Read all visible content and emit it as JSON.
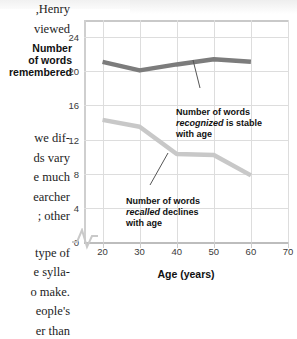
{
  "page": {
    "body_text_lines_top": [
      ",Henry",
      "viewed"
    ],
    "body_text_lines_mid": [
      "we dif-",
      "ds vary",
      "e much",
      "earcher",
      "; other"
    ],
    "body_text_lines_bottom": [
      "type of",
      "e sylla-",
      "o make.",
      "eople's",
      "er than"
    ]
  },
  "figure": {
    "y_axis_title_lines": [
      "Number",
      "of words",
      "remembered"
    ],
    "x_axis_title": "Age (years)",
    "annotation_recognized": {
      "line1": "Number of words",
      "line2_italic": "recognized",
      "line2_rest": " is stable",
      "line3": "with age"
    },
    "annotation_recalled": {
      "line1": "Number of words",
      "line2_italic": "recalled",
      "line2_rest": " declines",
      "line3": "with age"
    },
    "colors": {
      "recognized_line": "#7c7c7c",
      "recalled_line": "#c8c8c8",
      "gridline": "#dddddd",
      "axis": "#c9c9c9",
      "text": "#111111"
    }
  },
  "chart_data": {
    "type": "line",
    "title": "",
    "xlabel": "Age (years)",
    "ylabel": "Number of words remembered",
    "x": [
      20,
      30,
      40,
      50,
      60
    ],
    "xlim": [
      15,
      70
    ],
    "ylim": [
      0,
      26
    ],
    "xticks": [
      20,
      30,
      40,
      50,
      60,
      70
    ],
    "yticks": [
      0,
      4,
      8,
      12,
      16,
      20,
      24
    ],
    "grid": true,
    "legend": "none (inline annotations)",
    "axis_break_x": true,
    "series": [
      {
        "name": "Number of words recognized",
        "color": "#7c7c7c",
        "values": [
          21.1,
          20.1,
          20.8,
          21.4,
          21.1
        ]
      },
      {
        "name": "Number of words recalled",
        "color": "#c8c8c8",
        "values": [
          14.3,
          13.5,
          10.3,
          10.2,
          7.8
        ]
      }
    ]
  }
}
